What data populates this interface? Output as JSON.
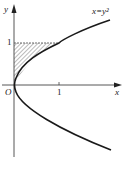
{
  "diagram": {
    "type": "function-plot",
    "curve_label": "x=y²",
    "axis_labels": {
      "x": "x",
      "y": "y",
      "origin": "O"
    },
    "ticks": {
      "x": [
        "1"
      ],
      "y": [
        "1"
      ]
    },
    "shaded_region": "region between y-axis, line y=1 and curve x=y² for 0≤y≤1",
    "colors": {
      "stroke": "#222222",
      "background": "#ffffff"
    }
  }
}
